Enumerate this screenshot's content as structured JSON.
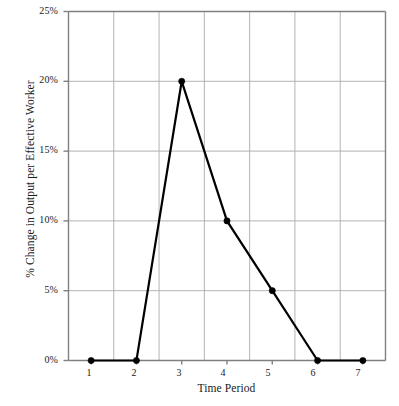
{
  "chart_data": {
    "type": "line",
    "title": "",
    "xlabel": "Time Period",
    "ylabel": "% Change in Output per Effective Worker",
    "x": [
      1,
      2,
      3,
      4,
      5,
      6,
      7
    ],
    "values": [
      0,
      0,
      20,
      10,
      5,
      0,
      0
    ],
    "series": [
      {
        "name": "% Change in Output per Effective Worker",
        "values": [
          0,
          0,
          20,
          10,
          5,
          0,
          0
        ]
      }
    ],
    "xtick_labels": [
      "1",
      "2",
      "3",
      "4",
      "5",
      "6",
      "7"
    ],
    "ytick_labels": [
      "0%",
      "5%",
      "10%",
      "15%",
      "20%",
      "25%"
    ],
    "ytick_values": [
      0,
      5,
      10,
      15,
      20,
      25
    ],
    "ylim": [
      0,
      25
    ],
    "xlim": [
      0.5,
      7.5
    ],
    "grid": true,
    "legend": false,
    "legend_position": "none",
    "line_color": "#000000",
    "marker_color": "#000000",
    "grid_color": "#b3b3b3",
    "axis_color": "#808080",
    "background_color": "#ffffff"
  }
}
